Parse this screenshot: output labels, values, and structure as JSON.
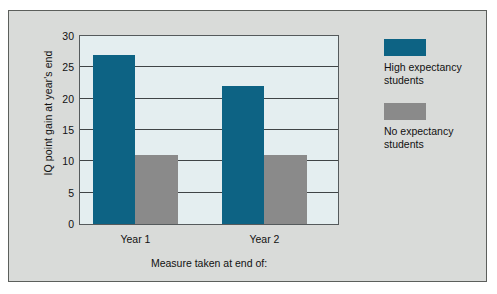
{
  "chart_data": {
    "type": "bar",
    "title": "",
    "xlabel": "Measure taken at end of:",
    "ylabel": "IQ point gain at year's end",
    "categories": [
      "Year 1",
      "Year 2"
    ],
    "ylim": [
      0,
      30
    ],
    "yticks": [
      0,
      5,
      10,
      15,
      20,
      25,
      30
    ],
    "ytick_labels": [
      "0",
      "5",
      "10",
      "15",
      "20",
      "25",
      "30"
    ],
    "grid": true,
    "legend_position": "right",
    "series": [
      {
        "name": "High expectancy students",
        "color": "#0d6384",
        "values": [
          27,
          22
        ]
      },
      {
        "name": "No expectancy students",
        "color": "#8a8a8a",
        "values": [
          11,
          11
        ]
      }
    ]
  },
  "colors": {
    "page_background": "#d9dbd9",
    "plot_background": "#e4eef0",
    "axis": "#3f4446",
    "high_expectancy": "#0d6384",
    "no_expectancy": "#8a8a8a"
  }
}
